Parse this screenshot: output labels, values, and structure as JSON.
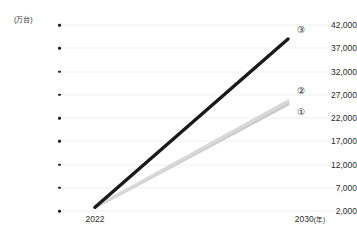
{
  "chart_data": {
    "type": "line",
    "title": "",
    "subtitle": "",
    "xlabel": "年",
    "ylabel": "万台",
    "unit_label": "(万台)",
    "x": [
      2022,
      2030
    ],
    "x_tick_labels": [
      "2022",
      "2030"
    ],
    "x_axis_unit_suffix": "(年)",
    "xlim": [
      2022,
      2030
    ],
    "ylim": [
      2000,
      42000
    ],
    "y_ticks": [
      2000,
      7000,
      12000,
      17000,
      22000,
      27000,
      32000,
      37000,
      42000
    ],
    "y_tick_labels": [
      "2,000",
      "7,000",
      "12,000",
      "17,000",
      "22,000",
      "27,000",
      "32,000",
      "37,000",
      "42,000"
    ],
    "grid": true,
    "grid_axis": "y",
    "legend_position": "right-end-of-line",
    "series": [
      {
        "name": "①",
        "label": "①",
        "color": "#c9c9c9",
        "values": [
          2800,
          25000
        ]
      },
      {
        "name": "②",
        "label": "②",
        "color": "#d8d8d8",
        "values": [
          2800,
          25600
        ]
      },
      {
        "name": "③",
        "label": "③",
        "color": "#1a1a1a",
        "values": [
          2800,
          39000
        ]
      }
    ]
  },
  "axis": {
    "unit_label": "(万台)",
    "y_tick_labels": [
      "42,000",
      "37,000",
      "32,000",
      "27,000",
      "22,000",
      "17,000",
      "12,000",
      "7,000",
      "2,000"
    ],
    "x_start_label": "2022",
    "x_end_label": "2030",
    "x_end_unit": "(年)"
  },
  "series_labels": [
    {
      "text": "③"
    },
    {
      "text": "②"
    },
    {
      "text": "①"
    }
  ],
  "colors": {
    "background": "#ffffff",
    "grid": "#f0f0f0",
    "text": "#2e2e2e",
    "series_3": "#1a1a1a",
    "series_2": "#d8d8d8",
    "series_1": "#c9c9c9"
  }
}
